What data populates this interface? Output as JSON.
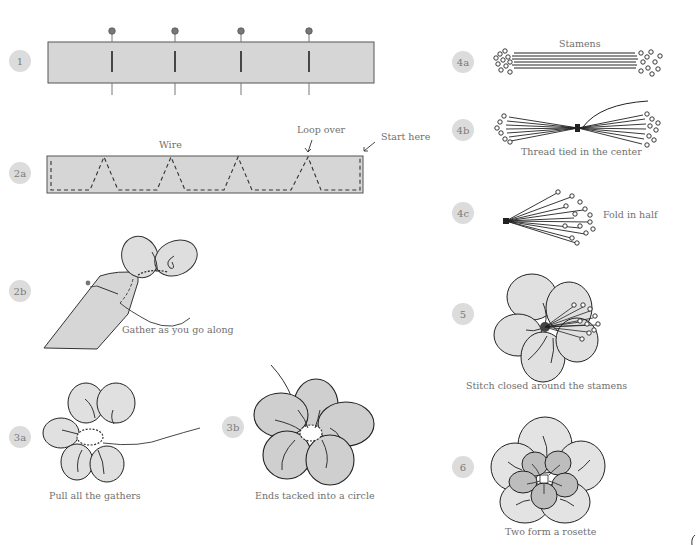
{
  "steps": [
    {
      "id": "1",
      "label": "1"
    },
    {
      "id": "2a",
      "label": "2a"
    },
    {
      "id": "2b",
      "label": "2b"
    },
    {
      "id": "3a",
      "label": "3a"
    },
    {
      "id": "3b",
      "label": "3b"
    },
    {
      "id": "4a",
      "label": "4a"
    },
    {
      "id": "4b",
      "label": "4b"
    },
    {
      "id": "4c",
      "label": "4c"
    },
    {
      "id": "5",
      "label": "5"
    },
    {
      "id": "6",
      "label": "6"
    }
  ],
  "captions": {
    "wire": "Wire",
    "loop_over": "Loop over",
    "start_here": "Start here",
    "gather": "Gather as you go along",
    "pull": "Pull all the gathers",
    "ends_tacked": "Ends tacked into a circle",
    "stamens": "Stamens",
    "thread_tied": "Thread tied in the center",
    "fold_half": "Fold in half",
    "stitch_closed": "Stitch closed around the stamens",
    "rosette": "Two form a rosette"
  },
  "colors": {
    "fabric": "#d6d6d6",
    "fabric_dark": "#b9b9b9",
    "badge": "#dcdcdc",
    "line": "#222222",
    "caption": "#707070"
  }
}
